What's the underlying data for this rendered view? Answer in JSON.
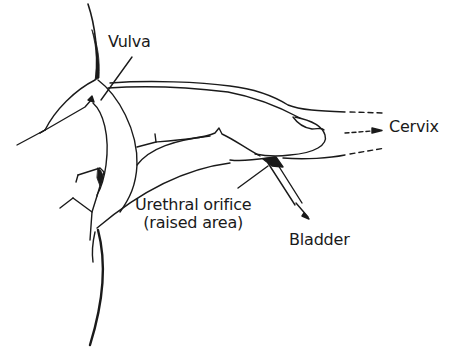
{
  "diagram": {
    "type": "anatomical line drawing",
    "labels": {
      "vulva": "Vulva",
      "cervix": "Cervix",
      "urethral_orifice_line1": "Urethral orifice",
      "urethral_orifice_line2": "(raised area)",
      "bladder": "Bladder"
    },
    "colors": {
      "stroke": "#1a1a1a",
      "background": "#ffffff"
    }
  }
}
